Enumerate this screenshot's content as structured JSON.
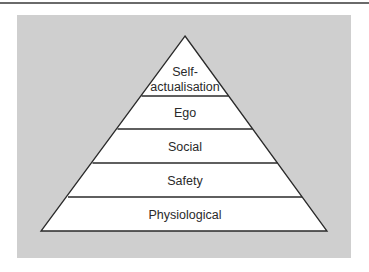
{
  "diagram": {
    "type": "pyramid",
    "levels": [
      {
        "label_line1": "Self-",
        "label_line2": "actualisation"
      },
      {
        "label": "Ego"
      },
      {
        "label": "Social"
      },
      {
        "label": "Safety"
      },
      {
        "label": "Physiological"
      }
    ]
  },
  "colors": {
    "panel": "#cfcfcf",
    "fill": "#ffffff",
    "stroke": "#2a2a2a"
  }
}
